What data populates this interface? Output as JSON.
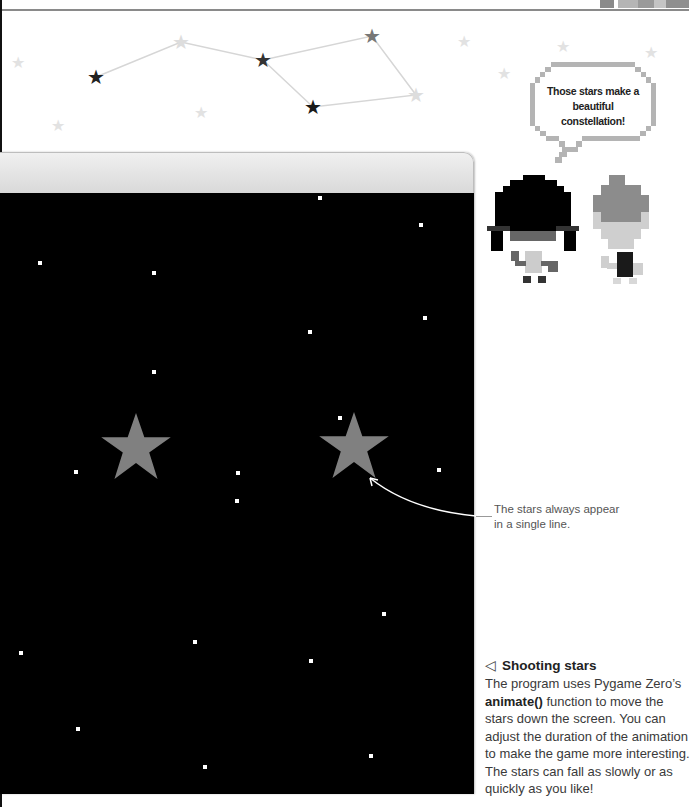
{
  "constellation": {
    "stars": [
      {
        "x": 96,
        "y": 77,
        "color": "#222222"
      },
      {
        "x": 181,
        "y": 42,
        "color": "#dddddd"
      },
      {
        "x": 263,
        "y": 60,
        "color": "#333333"
      },
      {
        "x": 372,
        "y": 36,
        "color": "#777777"
      },
      {
        "x": 313,
        "y": 107,
        "color": "#1a1a1a"
      },
      {
        "x": 416,
        "y": 95,
        "color": "#dddddd"
      }
    ],
    "line_color": "#d6d6d6",
    "background_stars": [
      {
        "x": 18,
        "y": 63
      },
      {
        "x": 58,
        "y": 126
      },
      {
        "x": 201,
        "y": 113
      },
      {
        "x": 464,
        "y": 42
      },
      {
        "x": 563,
        "y": 47
      },
      {
        "x": 651,
        "y": 53
      },
      {
        "x": 504,
        "y": 74
      }
    ],
    "background_star_color": "#e2e2e2"
  },
  "speech_bubble": {
    "text": "Those stars make a beautiful constellation!",
    "border_color": "#b4b4b4"
  },
  "characters": [
    {
      "name": "dark-haired-character",
      "hair": "#000000"
    },
    {
      "name": "gray-haired-character",
      "hair": "#8c8c8c"
    }
  ],
  "game_window": {
    "title": "",
    "background": "#000000",
    "falling_stars": [
      {
        "x": 136,
        "y": 446,
        "color": "#808080"
      },
      {
        "x": 354,
        "y": 445,
        "color": "#808080"
      }
    ],
    "dots": [
      {
        "x": 320,
        "y": 198
      },
      {
        "x": 421,
        "y": 225
      },
      {
        "x": 40,
        "y": 263
      },
      {
        "x": 154,
        "y": 273
      },
      {
        "x": 425,
        "y": 318
      },
      {
        "x": 310,
        "y": 332
      },
      {
        "x": 154,
        "y": 372
      },
      {
        "x": 340,
        "y": 418
      },
      {
        "x": 76,
        "y": 472
      },
      {
        "x": 238,
        "y": 473
      },
      {
        "x": 439,
        "y": 470
      },
      {
        "x": 237,
        "y": 501
      },
      {
        "x": 384,
        "y": 614
      },
      {
        "x": 195,
        "y": 642
      },
      {
        "x": 21,
        "y": 653
      },
      {
        "x": 311,
        "y": 661
      },
      {
        "x": 78,
        "y": 729
      },
      {
        "x": 371,
        "y": 756
      },
      {
        "x": 205,
        "y": 767
      }
    ]
  },
  "annotation": {
    "line1": "The stars always appear",
    "line2": "in a single line."
  },
  "caption": {
    "icon": "◁",
    "title": "Shooting stars",
    "body_before": "The program uses Pygame Zero’s ",
    "body_bold": "animate()",
    "body_after": " function to move the stars down the screen. You can adjust the duration of the animation to make the game more interesting. The stars can fall as slowly or as quickly as you like!"
  }
}
